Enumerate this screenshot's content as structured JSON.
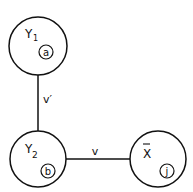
{
  "diagram": {
    "nodes": [
      {
        "id": "Y1",
        "label": "Y",
        "subscript": "1",
        "tag": "a"
      },
      {
        "id": "Y2",
        "label": "Y",
        "subscript": "2",
        "tag": "b"
      },
      {
        "id": "Xbar",
        "label": "X",
        "overbar": true,
        "tag": "j"
      }
    ],
    "edges": [
      {
        "from": "Y1",
        "to": "Y2",
        "label": "v′"
      },
      {
        "from": "Y2",
        "to": "Xbar",
        "label": "v"
      }
    ]
  }
}
